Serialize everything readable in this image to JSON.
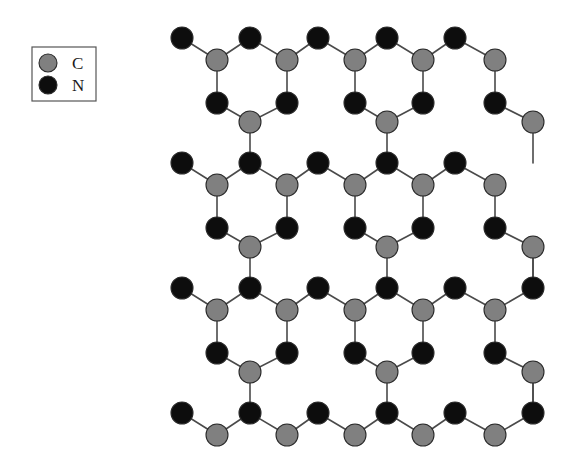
{
  "figure": {
    "title": "",
    "background_color": "#ffffff",
    "width": 578,
    "height": 454
  },
  "legend": {
    "name": "element-legend",
    "box": {
      "x": 32,
      "y": 47,
      "width": 64,
      "height": 54
    },
    "entries": [
      {
        "symbol": "C",
        "label": "C",
        "color": "#808080",
        "marker": "circle",
        "cx": 48,
        "cy": 63,
        "r": 9
      },
      {
        "symbol": "N",
        "label": "N",
        "color": "#0d0d0d",
        "marker": "circle",
        "cx": 48,
        "cy": 85,
        "r": 9
      }
    ]
  },
  "structure": {
    "name": "graphitic-carbon-nitride-lattice",
    "description": "Planar triazine-based carbon nitride sheet",
    "atom_radius_c": 11,
    "atom_radius_n": 11,
    "color_c": "#808080",
    "color_n": "#0d0d0d",
    "bond_color": "#4a4a4a",
    "bond_width": 1.6,
    "lattice": {
      "x_start": 182,
      "x_step": 68,
      "x_half": 34,
      "y_rows": [
        38,
        163,
        288,
        413
      ],
      "row_offsets": {
        "n_top": 0,
        "c_upper": 22,
        "n_lower": 65,
        "c_bottom": 84
      },
      "columns": 6
    },
    "atoms": [
      {
        "id": "n-r0-c0",
        "el": "N",
        "x": 182,
        "y": 38
      },
      {
        "id": "c-r0-c0",
        "el": "C",
        "x": 217,
        "y": 60
      },
      {
        "id": "n-r0-c1",
        "el": "N",
        "x": 250,
        "y": 38
      },
      {
        "id": "c-r0-c1",
        "el": "C",
        "x": 287,
        "y": 60
      },
      {
        "id": "n-r0-c2",
        "el": "N",
        "x": 318,
        "y": 38
      },
      {
        "id": "c-r0-c2",
        "el": "C",
        "x": 355,
        "y": 60
      },
      {
        "id": "n-r0-c3",
        "el": "N",
        "x": 387,
        "y": 38
      },
      {
        "id": "c-r0-c3",
        "el": "C",
        "x": 423,
        "y": 60
      },
      {
        "id": "n-r0-c4",
        "el": "N",
        "x": 455,
        "y": 38
      },
      {
        "id": "c-r0-c4",
        "el": "C",
        "x": 495,
        "y": 60
      },
      {
        "id": "n-r0l-c0",
        "el": "N",
        "x": 217,
        "y": 103
      },
      {
        "id": "n-r0l-c1",
        "el": "N",
        "x": 287,
        "y": 103
      },
      {
        "id": "n-r0l-c2",
        "el": "N",
        "x": 355,
        "y": 103
      },
      {
        "id": "n-r0l-c3",
        "el": "N",
        "x": 423,
        "y": 103
      },
      {
        "id": "n-r0l-c4",
        "el": "N",
        "x": 495,
        "y": 103
      },
      {
        "id": "c-r0b-c0",
        "el": "C",
        "x": 250,
        "y": 122
      },
      {
        "id": "c-r0b-c1",
        "el": "C",
        "x": 387,
        "y": 122
      },
      {
        "id": "c-r0b-edge",
        "el": "C",
        "x": 533,
        "y": 122
      },
      {
        "id": "n-r1-c0",
        "el": "N",
        "x": 182,
        "y": 163
      },
      {
        "id": "c-r1-c0",
        "el": "C",
        "x": 217,
        "y": 185
      },
      {
        "id": "n-r1-c1",
        "el": "N",
        "x": 250,
        "y": 163
      },
      {
        "id": "c-r1-c1",
        "el": "C",
        "x": 287,
        "y": 185
      },
      {
        "id": "n-r1-c2",
        "el": "N",
        "x": 318,
        "y": 163
      },
      {
        "id": "c-r1-c2",
        "el": "C",
        "x": 355,
        "y": 185
      },
      {
        "id": "n-r1-c3",
        "el": "N",
        "x": 387,
        "y": 163
      },
      {
        "id": "c-r1-c3",
        "el": "C",
        "x": 423,
        "y": 185
      },
      {
        "id": "n-r1-c4",
        "el": "N",
        "x": 455,
        "y": 163
      },
      {
        "id": "c-r1-c4",
        "el": "C",
        "x": 495,
        "y": 185
      },
      {
        "id": "n-r1l-c0",
        "el": "N",
        "x": 217,
        "y": 228
      },
      {
        "id": "n-r1l-c1",
        "el": "N",
        "x": 287,
        "y": 228
      },
      {
        "id": "n-r1l-c2",
        "el": "N",
        "x": 355,
        "y": 228
      },
      {
        "id": "n-r1l-c3",
        "el": "N",
        "x": 423,
        "y": 228
      },
      {
        "id": "n-r1l-c4",
        "el": "N",
        "x": 495,
        "y": 228
      },
      {
        "id": "c-r1b-c0",
        "el": "C",
        "x": 250,
        "y": 247
      },
      {
        "id": "c-r1b-c1",
        "el": "C",
        "x": 387,
        "y": 247
      },
      {
        "id": "c-r1b-edge",
        "el": "C",
        "x": 533,
        "y": 247
      },
      {
        "id": "n-r2-c0",
        "el": "N",
        "x": 182,
        "y": 288
      },
      {
        "id": "c-r2-c0",
        "el": "C",
        "x": 217,
        "y": 310
      },
      {
        "id": "n-r2-c1",
        "el": "N",
        "x": 250,
        "y": 288
      },
      {
        "id": "c-r2-c1",
        "el": "C",
        "x": 287,
        "y": 310
      },
      {
        "id": "n-r2-c2",
        "el": "N",
        "x": 318,
        "y": 288
      },
      {
        "id": "c-r2-c2",
        "el": "C",
        "x": 355,
        "y": 310
      },
      {
        "id": "n-r2-c3",
        "el": "N",
        "x": 387,
        "y": 288
      },
      {
        "id": "c-r2-c3",
        "el": "C",
        "x": 423,
        "y": 310
      },
      {
        "id": "n-r2-c4",
        "el": "N",
        "x": 455,
        "y": 288
      },
      {
        "id": "c-r2-c4",
        "el": "C",
        "x": 495,
        "y": 310
      },
      {
        "id": "n-r2-c5",
        "el": "N",
        "x": 533,
        "y": 288
      },
      {
        "id": "n-r2l-c0",
        "el": "N",
        "x": 217,
        "y": 353
      },
      {
        "id": "n-r2l-c1",
        "el": "N",
        "x": 287,
        "y": 353
      },
      {
        "id": "n-r2l-c2",
        "el": "N",
        "x": 355,
        "y": 353
      },
      {
        "id": "n-r2l-c3",
        "el": "N",
        "x": 423,
        "y": 353
      },
      {
        "id": "n-r2l-c4",
        "el": "N",
        "x": 495,
        "y": 353
      },
      {
        "id": "c-r2b-c0",
        "el": "C",
        "x": 250,
        "y": 372
      },
      {
        "id": "c-r2b-c1",
        "el": "C",
        "x": 387,
        "y": 372
      },
      {
        "id": "c-r2b-edge",
        "el": "C",
        "x": 533,
        "y": 372
      },
      {
        "id": "n-r3-c0",
        "el": "N",
        "x": 182,
        "y": 413
      },
      {
        "id": "c-r3-c0",
        "el": "C",
        "x": 217,
        "y": 435
      },
      {
        "id": "n-r3-c1",
        "el": "N",
        "x": 250,
        "y": 413
      },
      {
        "id": "c-r3-c1",
        "el": "C",
        "x": 287,
        "y": 435
      },
      {
        "id": "n-r3-c2",
        "el": "N",
        "x": 318,
        "y": 413
      },
      {
        "id": "c-r3-c2",
        "el": "C",
        "x": 355,
        "y": 435
      },
      {
        "id": "n-r3-c3",
        "el": "N",
        "x": 387,
        "y": 413
      },
      {
        "id": "c-r3-c3",
        "el": "C",
        "x": 423,
        "y": 435
      },
      {
        "id": "n-r3-c4",
        "el": "N",
        "x": 455,
        "y": 413
      },
      {
        "id": "c-r3-c4",
        "el": "C",
        "x": 495,
        "y": 435
      },
      {
        "id": "n-r3-c5",
        "el": "N",
        "x": 533,
        "y": 413
      }
    ],
    "bonds": [
      [
        "n-r0-c0",
        "c-r0-c0"
      ],
      [
        "c-r0-c0",
        "n-r0-c1"
      ],
      [
        "n-r0-c1",
        "c-r0-c1"
      ],
      [
        "c-r0-c1",
        "n-r0-c2"
      ],
      [
        "n-r0-c2",
        "c-r0-c2"
      ],
      [
        "c-r0-c2",
        "n-r0-c3"
      ],
      [
        "n-r0-c3",
        "c-r0-c3"
      ],
      [
        "c-r0-c3",
        "n-r0-c4"
      ],
      [
        "n-r0-c4",
        "c-r0-c4"
      ],
      [
        "c-r0-c0",
        "n-r0l-c0"
      ],
      [
        "c-r0-c1",
        "n-r0l-c1"
      ],
      [
        "c-r0-c2",
        "n-r0l-c2"
      ],
      [
        "c-r0-c3",
        "n-r0l-c3"
      ],
      [
        "c-r0-c4",
        "n-r0l-c4"
      ],
      [
        "n-r0l-c0",
        "c-r0b-c0"
      ],
      [
        "c-r0b-c0",
        "n-r0l-c1"
      ],
      [
        "n-r0l-c2",
        "c-r0b-c1"
      ],
      [
        "c-r0b-c1",
        "n-r0l-c3"
      ],
      [
        "n-r0l-c4",
        "c-r0b-edge"
      ],
      [
        "c-r0b-c0",
        "n-r1-c1"
      ],
      [
        "c-r0b-c1",
        "n-r1-c3"
      ],
      [
        "c-r0b-edge",
        "n-r1-c5x"
      ],
      [
        "n-r1-c0",
        "c-r1-c0"
      ],
      [
        "c-r1-c0",
        "n-r1-c1"
      ],
      [
        "n-r1-c1",
        "c-r1-c1"
      ],
      [
        "c-r1-c1",
        "n-r1-c2"
      ],
      [
        "n-r1-c2",
        "c-r1-c2"
      ],
      [
        "c-r1-c2",
        "n-r1-c3"
      ],
      [
        "n-r1-c3",
        "c-r1-c3"
      ],
      [
        "c-r1-c3",
        "n-r1-c4"
      ],
      [
        "n-r1-c4",
        "c-r1-c4"
      ],
      [
        "c-r1-c0",
        "n-r1l-c0"
      ],
      [
        "c-r1-c1",
        "n-r1l-c1"
      ],
      [
        "c-r1-c2",
        "n-r1l-c2"
      ],
      [
        "c-r1-c3",
        "n-r1l-c3"
      ],
      [
        "c-r1-c4",
        "n-r1l-c4"
      ],
      [
        "n-r1l-c0",
        "c-r1b-c0"
      ],
      [
        "c-r1b-c0",
        "n-r1l-c1"
      ],
      [
        "n-r1l-c2",
        "c-r1b-c1"
      ],
      [
        "c-r1b-c1",
        "n-r1l-c3"
      ],
      [
        "n-r1l-c4",
        "c-r1b-edge"
      ],
      [
        "c-r1b-c0",
        "n-r2-c1"
      ],
      [
        "c-r1b-c1",
        "n-r2-c3"
      ],
      [
        "c-r1b-edge",
        "n-r2-c5"
      ],
      [
        "n-r2-c0",
        "c-r2-c0"
      ],
      [
        "c-r2-c0",
        "n-r2-c1"
      ],
      [
        "n-r2-c1",
        "c-r2-c1"
      ],
      [
        "c-r2-c1",
        "n-r2-c2"
      ],
      [
        "n-r2-c2",
        "c-r2-c2"
      ],
      [
        "c-r2-c2",
        "n-r2-c3"
      ],
      [
        "n-r2-c3",
        "c-r2-c3"
      ],
      [
        "c-r2-c3",
        "n-r2-c4"
      ],
      [
        "n-r2-c4",
        "c-r2-c4"
      ],
      [
        "c-r2-c4",
        "n-r2-c5"
      ],
      [
        "c-r2-c0",
        "n-r2l-c0"
      ],
      [
        "c-r2-c1",
        "n-r2l-c1"
      ],
      [
        "c-r2-c2",
        "n-r2l-c2"
      ],
      [
        "c-r2-c3",
        "n-r2l-c3"
      ],
      [
        "c-r2-c4",
        "n-r2l-c4"
      ],
      [
        "n-r2l-c0",
        "c-r2b-c0"
      ],
      [
        "c-r2b-c0",
        "n-r2l-c1"
      ],
      [
        "n-r2l-c2",
        "c-r2b-c1"
      ],
      [
        "c-r2b-c1",
        "n-r2l-c3"
      ],
      [
        "n-r2l-c4",
        "c-r2b-edge"
      ],
      [
        "c-r2b-c0",
        "n-r3-c1"
      ],
      [
        "c-r2b-c1",
        "n-r3-c3"
      ],
      [
        "c-r2b-edge",
        "n-r3-c5"
      ],
      [
        "n-r3-c0",
        "c-r3-c0"
      ],
      [
        "c-r3-c0",
        "n-r3-c1"
      ],
      [
        "n-r3-c1",
        "c-r3-c1"
      ],
      [
        "c-r3-c1",
        "n-r3-c2"
      ],
      [
        "n-r3-c2",
        "c-r3-c2"
      ],
      [
        "c-r3-c2",
        "n-r3-c3"
      ],
      [
        "n-r3-c3",
        "c-r3-c3"
      ],
      [
        "c-r3-c3",
        "n-r3-c4"
      ],
      [
        "n-r3-c4",
        "c-r3-c4"
      ],
      [
        "c-r3-c4",
        "n-r3-c5"
      ]
    ]
  }
}
